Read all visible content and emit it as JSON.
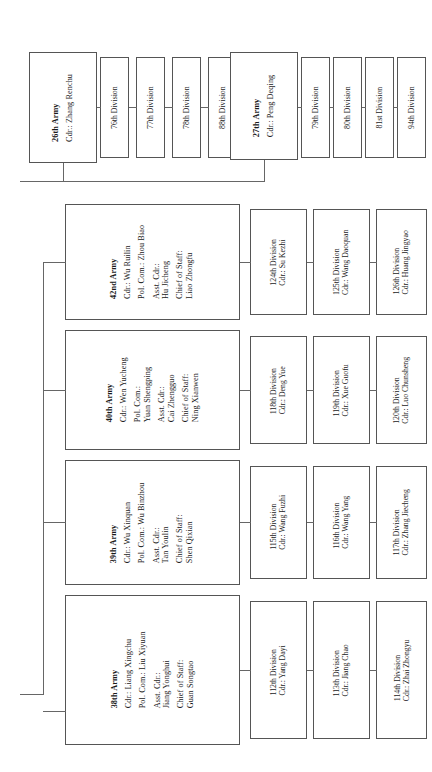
{
  "chart": {
    "orientation": "rotated-90-ccw",
    "line_color": "#666666",
    "box_border_color": "#555555",
    "background": "#ffffff"
  },
  "top_group": {
    "armies": [
      {
        "name": "26th Army",
        "commander": "Cdr.: Zhang Renchu",
        "divisions": [
          {
            "name": "76th Division"
          },
          {
            "name": "77th Division"
          },
          {
            "name": "78th Division"
          },
          {
            "name": "88th Division"
          }
        ]
      },
      {
        "name": "27th Army",
        "commander": "Cdr.: Peng Deqing",
        "divisions": [
          {
            "name": "79th Division"
          },
          {
            "name": "80th Division"
          },
          {
            "name": "81st Division"
          },
          {
            "name": "94th Division"
          }
        ]
      }
    ]
  },
  "bottom_group": {
    "armies": [
      {
        "name": "42nd Army",
        "commander": "Cdr.: Wu Ruilin",
        "political_commissar": "Pol. Com.: Zhou Biao",
        "asst_commander_label": "Asst. Cdr.:",
        "asst_commander_name": "Hu Jicheng",
        "chief_of_staff_label": "Chief of Staff:",
        "chief_of_staff_name": "Liao Zhongfu",
        "divisions": [
          {
            "name": "124th Division",
            "commander": "Cdr.: Su Kezhi"
          },
          {
            "name": "125th Division",
            "commander": "Cdr.: Wang Daoquan"
          },
          {
            "name": "126th Division",
            "commander": "Cdr.: Huang Jingyao"
          }
        ]
      },
      {
        "name": "40th Army",
        "commander": "Cdr.: Wen Yucheng",
        "political_commissar_label": "Pol. Com.:",
        "political_commissar_name": "Yuan Shengping",
        "asst_commander_label": "Asst. Cdr.:",
        "asst_commander_name": "Cai Zhengguo",
        "chief_of_staff_label": "Chief of Staff:",
        "chief_of_staff_name": "Ning Xianwen",
        "divisions": [
          {
            "name": "118th Division",
            "commander": "Cdr.: Deng Yue"
          },
          {
            "name": "119th Division",
            "commander": "Cdr.: Xue Guofu"
          },
          {
            "name": "120th Division",
            "commander": "Cdr.: Luo Chunsheng"
          }
        ]
      },
      {
        "name": "39th Army",
        "commander": "Cdr.: Wu Xinquan",
        "political_commissar": "Pol. Com.: Wu Binzhou",
        "asst_commander_label": "Asst. Cdr.:",
        "asst_commander_name": "Tan Youlin",
        "chief_of_staff_label": "Chief of Staff:",
        "chief_of_staff_name": "Shen Qixian",
        "divisions": [
          {
            "name": "115th Division",
            "commander": "Cdr.: Wang Fuzhi"
          },
          {
            "name": "116th Division",
            "commander": "Cdr.: Wang Yang"
          },
          {
            "name": "117th Division",
            "commander": "Cdr.: Zhang Jiecheng"
          }
        ]
      },
      {
        "name": "38th Army",
        "commander": "Cdr.: Liang Xingchu",
        "political_commissar": "Pol. Com.: Liu Xiyuan",
        "asst_commander_label": "Asst. Cdr.:",
        "asst_commander_name": "Jiang Yonghui",
        "chief_of_staff_label": "Chief of Staff:",
        "chief_of_staff_name": "Guan Songtao",
        "divisions": [
          {
            "name": "112th Division",
            "commander": "Cdr.: Yang Dayi"
          },
          {
            "name": "113th Division",
            "commander": "Cdr.: Jiang Chao"
          },
          {
            "name": "114th Division",
            "commander": "Cdr.: Zhai Zhongyu"
          }
        ]
      }
    ]
  }
}
